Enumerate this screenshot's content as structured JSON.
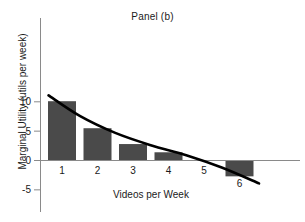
{
  "chart_data": {
    "type": "bar",
    "title": "Panel (b)",
    "xlabel": "Videos per Week",
    "ylabel": "Marginal Utility (utils per week)",
    "categories": [
      "1",
      "2",
      "3",
      "4",
      "5",
      "6"
    ],
    "values": [
      10.1,
      5.5,
      2.8,
      1.4,
      0,
      -2.7
    ],
    "ytick_labels": [
      "10",
      "5",
      "0",
      "-5"
    ],
    "ytick_values": [
      10,
      5,
      0,
      -5
    ],
    "ylim": [
      -5,
      14
    ],
    "xlim": [
      0.4,
      6.9
    ],
    "grid": false,
    "legend": "none",
    "bar_color": "#4a4a4a",
    "axis_color": "#8a8a8a",
    "curve_color": "#000000",
    "series": [
      {
        "name": "Marginal Utility (bars)",
        "kind": "bar",
        "values": [
          10.1,
          5.5,
          2.8,
          1.4,
          0,
          -2.7
        ]
      },
      {
        "name": "Marginal Utility curve",
        "kind": "line",
        "x": [
          0.62,
          1.5,
          2.5,
          3.5,
          4.5,
          5.5,
          6.55
        ],
        "y": [
          11.1,
          7.6,
          4.7,
          2.6,
          0.9,
          -1.2,
          -3.9
        ]
      }
    ]
  },
  "annotations": {
    "zero_line": 0
  }
}
